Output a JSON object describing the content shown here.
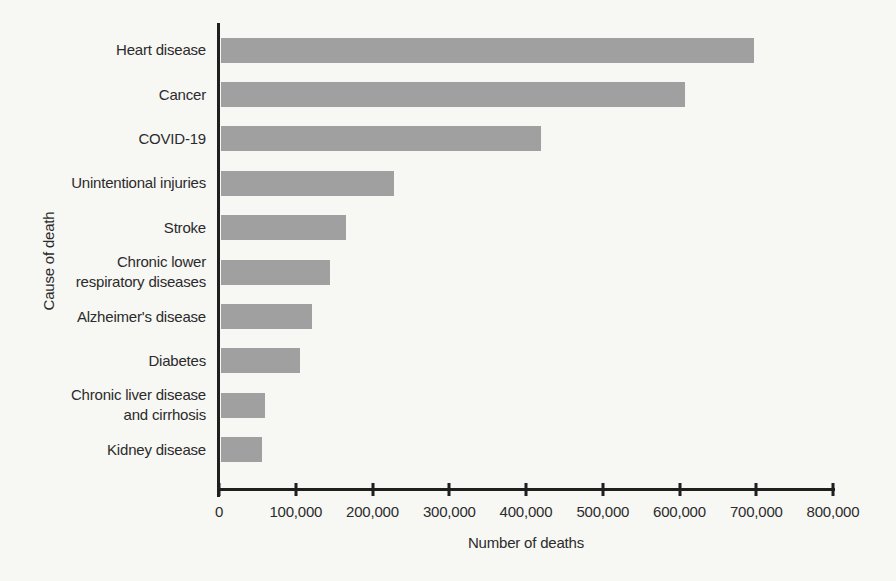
{
  "page": {
    "background_color": "#f7f7f4"
  },
  "chart_data": {
    "type": "bar",
    "orientation": "horizontal",
    "title": "",
    "xlabel": "Number of deaths",
    "ylabel": "Cause of death",
    "categories": [
      "Heart disease",
      "Cancer",
      "COVID-19",
      "Unintentional injuries",
      "Stroke",
      "Chronic lower respiratory diseases",
      "Alzheimer's disease",
      "Diabetes",
      "Chronic liver disease and cirrhosis",
      "Kidney disease"
    ],
    "category_lines": [
      [
        "Heart disease"
      ],
      [
        "Cancer"
      ],
      [
        "COVID-19"
      ],
      [
        "Unintentional injuries"
      ],
      [
        "Stroke"
      ],
      [
        "Chronic lower",
        "respiratory diseases"
      ],
      [
        "Alzheimer's disease"
      ],
      [
        "Diabetes"
      ],
      [
        "Chronic liver disease",
        "and cirrhosis"
      ],
      [
        "Kidney disease"
      ]
    ],
    "values": [
      695000,
      605000,
      417000,
      225000,
      163000,
      142000,
      119000,
      103000,
      57000,
      54000
    ],
    "xlim": [
      0,
      800000
    ],
    "x_ticks": [
      0,
      100000,
      200000,
      300000,
      400000,
      500000,
      600000,
      700000,
      800000
    ],
    "x_tick_labels": [
      "0",
      "100,000",
      "200,000",
      "300,000",
      "400,000",
      "500,000",
      "600,000",
      "700,000",
      "800,000"
    ],
    "grid": false,
    "legend": false,
    "bar_color": "#a0a0a0",
    "axis_color": "#1f1f1f",
    "text_color": "#2b2b2b"
  }
}
